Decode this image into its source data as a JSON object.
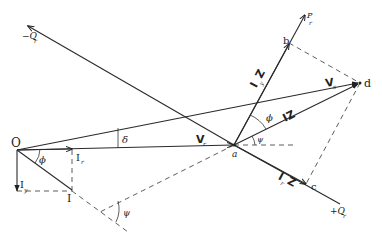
{
  "diagram": {
    "points": {
      "O": {
        "label": "O",
        "x": 17,
        "y": 150
      },
      "a": {
        "label": "a",
        "x": 234,
        "y": 145
      },
      "b": {
        "label": "b",
        "x": 289,
        "y": 43
      },
      "c": {
        "label": "c",
        "x": 306,
        "y": 184
      },
      "d": {
        "label": "d",
        "x": 360,
        "y": 83
      },
      "I": {
        "label": "I",
        "x": 72,
        "y": 191
      }
    },
    "axes": {
      "pr": {
        "label": "P",
        "sub": "r"
      },
      "neg_qr": {
        "label": "−Q",
        "sub": "r"
      },
      "pos_qr": {
        "label": "+Q",
        "sub": "r"
      }
    },
    "vectors": {
      "vr": {
        "label": "V",
        "sub": "r"
      },
      "vs": {
        "label": "V",
        "sub": "s"
      },
      "iz": {
        "label": "IZ"
      },
      "irz": {
        "label": "I",
        "sub": "r",
        "suffix": "Z",
        "display": "IrZ"
      },
      "iyz": {
        "label": "I",
        "sub": "y",
        "suffix": "Z",
        "display": "IyZ"
      },
      "ir": {
        "label": "I",
        "sub": "r"
      },
      "iy": {
        "label": "I",
        "sub": "y"
      }
    },
    "angles": {
      "delta": "δ",
      "phi_origin": "ϕ",
      "phi_a": "ϕ",
      "psi_a": "ψ",
      "psi_lower": "ψ"
    },
    "colors": {
      "line": "#2a2a2a",
      "background": "#ffffff"
    }
  }
}
